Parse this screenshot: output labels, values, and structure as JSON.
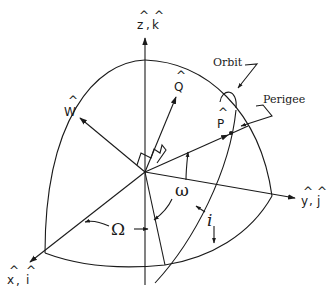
{
  "diagram": {
    "type": "orbital-elements-geometry",
    "axes": {
      "z": {
        "label": "ẑ, k̂",
        "letter1": "z",
        "letter2": "k"
      },
      "y": {
        "label": "ŷ, ĵ",
        "letter1": "y",
        "letter2": "j"
      },
      "x": {
        "label": "x̂, î",
        "letter1": "x",
        "letter2": "i"
      }
    },
    "vectors": {
      "W": {
        "label": "Ŵ",
        "letter": "W"
      },
      "Q": {
        "label": "Q̂",
        "letter": "Q"
      },
      "P": {
        "label": "P̂",
        "letter": "P"
      }
    },
    "angles": {
      "raan": {
        "symbol": "Ω"
      },
      "arg_perigee": {
        "symbol": "ω"
      },
      "inclination": {
        "symbol": "i"
      }
    },
    "annotations": {
      "orbit": "Orbit",
      "perigee": "Perigee"
    },
    "colors": {
      "ink": "#1a1a1a",
      "background": "#ffffff"
    }
  }
}
